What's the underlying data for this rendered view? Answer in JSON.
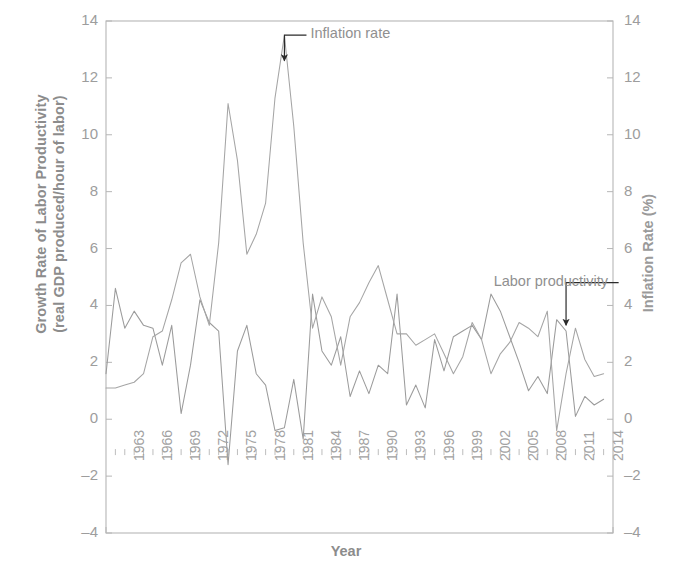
{
  "chart_data": {
    "type": "line",
    "title": "",
    "xlabel": "Year",
    "ylabel": "Growth Rate of Labor Productivity (real GDP produced/hour of labor)",
    "ylabel_line1": "Growth Rate of Labor Productivity",
    "ylabel_line2": "(real GDP produced/hour of labor)",
    "y2label": "Inflation Rate (%)",
    "ylim": [
      -4,
      14
    ],
    "y2lim": [
      -4,
      14
    ],
    "xlim": [
      1961,
      2015
    ],
    "grid": false,
    "legend_position": "inline-annotations",
    "yticks": [
      -4,
      -2,
      0,
      2,
      4,
      6,
      8,
      10,
      12,
      14
    ],
    "y2ticks": [
      -4,
      -2,
      0,
      2,
      4,
      6,
      8,
      10,
      12,
      14
    ],
    "xticks": [
      1963,
      1966,
      1969,
      1972,
      1975,
      1978,
      1981,
      1984,
      1987,
      1990,
      1993,
      1996,
      1999,
      2002,
      2005,
      2008,
      2011,
      2014
    ],
    "annotations": [
      {
        "text": "Inflation rate",
        "target_x": 1980,
        "target_y": 12.6,
        "label_x": 1981.5,
        "label_y": 13.5
      },
      {
        "text": "Labor productivity",
        "target_x": 2010,
        "target_y": 3.3,
        "label_x": 2002.5,
        "label_y": 4.8
      }
    ],
    "x": [
      1961,
      1962,
      1963,
      1964,
      1965,
      1966,
      1967,
      1968,
      1969,
      1970,
      1971,
      1972,
      1973,
      1974,
      1975,
      1976,
      1977,
      1978,
      1979,
      1980,
      1981,
      1982,
      1983,
      1984,
      1985,
      1986,
      1987,
      1988,
      1989,
      1990,
      1991,
      1992,
      1993,
      1994,
      1995,
      1996,
      1997,
      1998,
      1999,
      2000,
      2001,
      2002,
      2003,
      2004,
      2005,
      2006,
      2007,
      2008,
      2009,
      2010,
      2011,
      2012,
      2013,
      2014
    ],
    "series": [
      {
        "name": "Labor productivity",
        "axis": "left",
        "color": "#9b9b9b",
        "values": [
          1.6,
          4.6,
          3.2,
          3.8,
          3.3,
          3.2,
          1.9,
          3.3,
          0.2,
          1.9,
          4.2,
          3.4,
          3.1,
          -1.6,
          2.4,
          3.3,
          1.6,
          1.2,
          -0.4,
          -0.3,
          1.4,
          -0.7,
          4.4,
          2.4,
          1.9,
          2.9,
          0.8,
          1.7,
          0.9,
          1.9,
          1.6,
          4.4,
          0.5,
          1.2,
          0.4,
          2.8,
          1.7,
          2.9,
          3.1,
          3.3,
          2.8,
          4.4,
          3.8,
          2.9,
          2.0,
          1.0,
          1.5,
          0.9,
          3.5,
          3.1,
          0.1,
          0.8,
          0.5,
          0.7
        ]
      },
      {
        "name": "Inflation rate",
        "axis": "right",
        "color": "#a5a5a5",
        "values": [
          1.1,
          1.1,
          1.2,
          1.3,
          1.6,
          2.9,
          3.1,
          4.2,
          5.5,
          5.8,
          4.3,
          3.3,
          6.2,
          11.1,
          9.1,
          5.8,
          6.5,
          7.6,
          11.3,
          13.5,
          10.3,
          6.2,
          3.2,
          4.3,
          3.6,
          1.9,
          3.6,
          4.1,
          4.8,
          5.4,
          4.2,
          3.0,
          3.0,
          2.6,
          2.8,
          3.0,
          2.3,
          1.6,
          2.2,
          3.4,
          2.8,
          1.6,
          2.3,
          2.7,
          3.4,
          3.2,
          2.9,
          3.8,
          -0.4,
          1.6,
          3.2,
          2.1,
          1.5,
          1.6
        ]
      }
    ]
  },
  "axis_labels": {
    "y_left_line1": "Growth Rate of Labor Productivity",
    "y_left_line2": "(real GDP produced/hour of labor)",
    "y_right": "Inflation Rate (%)",
    "x": "Year"
  },
  "annotations": {
    "inflation": "Inflation rate",
    "productivity": "Labor productivity"
  },
  "colors": {
    "axis": "#b6b6b6",
    "text": "#8e8e8e",
    "line_productivity": "#9b9b9b",
    "line_inflation": "#a5a5a5",
    "arrow": "#2b2b2b",
    "background": "#ffffff"
  }
}
